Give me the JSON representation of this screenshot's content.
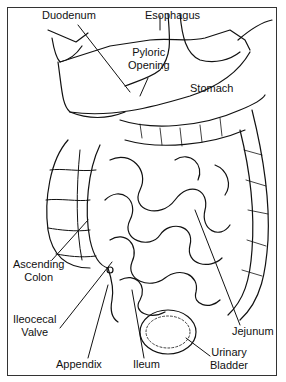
{
  "figure": {
    "border_color": "#333333",
    "line_color": "#111111"
  },
  "labels": {
    "duodenum": "Duodenum",
    "esophagus": "Esophagus",
    "pyloric_1": "Pyloric",
    "pyloric_2": "Opening",
    "stomach": "Stomach",
    "ascending_1": "Ascending",
    "ascending_2": "Colon",
    "ileocecal_1": "Ileocecal",
    "ileocecal_2": "Valve",
    "appendix": "Appendix",
    "ileum": "Ileum",
    "jejunum": "Jejunum",
    "bladder_1": "Urinary",
    "bladder_2": "Bladder"
  }
}
